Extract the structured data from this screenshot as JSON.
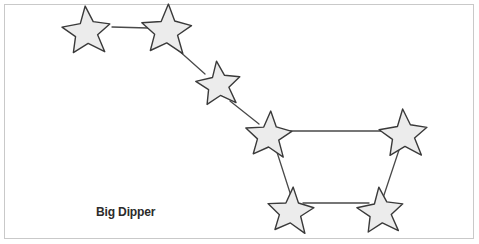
{
  "figure": {
    "caption": "Big Dipper",
    "border_color": "#c9c9c9",
    "background_color": "#ffffff"
  },
  "chart_data": {
    "type": "diagram",
    "title": "Big Dipper",
    "subtitle": "",
    "xlabel": "",
    "ylabel": "",
    "legend": [],
    "grid": false,
    "style": {
      "star_fill": "#ececec",
      "star_stroke": "#3a3a3a",
      "star_stroke_width": 1.4,
      "link_stroke": "#4a4a4a",
      "link_stroke_width": 1.3
    },
    "xlim": [
      0,
      479
    ],
    "ylim": [
      0,
      244
    ],
    "nodes": [
      {
        "id": "alkaid",
        "label": "",
        "x": 87,
        "y": 32,
        "r": 26,
        "rotation": -4,
        "role": "handle-end"
      },
      {
        "id": "mizar",
        "label": "",
        "x": 167,
        "y": 31,
        "r": 27,
        "rotation": 3,
        "role": "handle"
      },
      {
        "id": "alioth",
        "label": "",
        "x": 219,
        "y": 85,
        "r": 24,
        "rotation": -6,
        "role": "handle"
      },
      {
        "id": "megrez",
        "label": "",
        "x": 269,
        "y": 136,
        "r": 25,
        "rotation": 4,
        "role": "bowl-top-left"
      },
      {
        "id": "dubhe",
        "label": "",
        "x": 404,
        "y": 135,
        "r": 26,
        "rotation": -3,
        "role": "bowl-top-right"
      },
      {
        "id": "merak",
        "label": "",
        "x": 291,
        "y": 212,
        "r": 25,
        "rotation": 5,
        "role": "bowl-bottom-left"
      },
      {
        "id": "phecda",
        "label": "",
        "x": 381,
        "y": 212,
        "r": 25,
        "rotation": -5,
        "role": "bowl-bottom-right"
      }
    ],
    "links": [
      {
        "from": "alkaid",
        "to": "mizar",
        "x1": 112,
        "y1": 27,
        "x2": 148,
        "y2": 28
      },
      {
        "from": "mizar",
        "to": "alioth",
        "x1": 177,
        "y1": 49,
        "x2": 205,
        "y2": 74
      },
      {
        "from": "alioth",
        "to": "megrez",
        "x1": 230,
        "y1": 101,
        "x2": 259,
        "y2": 124
      },
      {
        "from": "megrez",
        "to": "dubhe",
        "x1": 284,
        "y1": 131,
        "x2": 389,
        "y2": 131
      },
      {
        "from": "megrez",
        "to": "merak",
        "x1": 275,
        "y1": 146,
        "x2": 292,
        "y2": 199
      },
      {
        "from": "merak",
        "to": "phecda",
        "x1": 303,
        "y1": 203,
        "x2": 369,
        "y2": 203
      },
      {
        "from": "phecda",
        "to": "dubhe",
        "x1": 383,
        "y1": 198,
        "x2": 399,
        "y2": 150
      }
    ]
  }
}
